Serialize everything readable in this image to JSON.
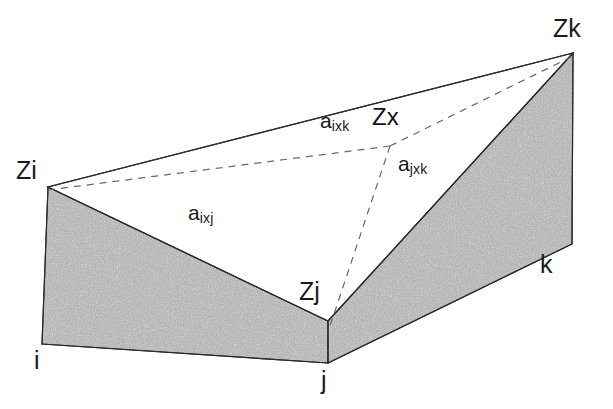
{
  "figure": {
    "type": "geometric-diagram",
    "background_color": "#ffffff",
    "ink_color": "#1a1a1a",
    "shade_fill": "#9a9a9a",
    "upper_vertices": [
      {
        "id": "Zi",
        "label": "Zi",
        "x": 48,
        "y": 187
      },
      {
        "id": "Zj",
        "label": "Zj",
        "x": 328,
        "y": 321
      },
      {
        "id": "Zk",
        "label": "Zk",
        "x": 573,
        "y": 53
      }
    ],
    "interior_point": {
      "id": "Zx",
      "label": "Zx",
      "x": 390,
      "y": 146
    },
    "base_vertices": [
      {
        "id": "i",
        "label": "i",
        "x": 42,
        "y": 344
      },
      {
        "id": "j",
        "label": "j",
        "x": 328,
        "y": 363
      },
      {
        "id": "k",
        "label": "k",
        "x": 572,
        "y": 244
      }
    ],
    "areas": [
      {
        "id": "a_ixj",
        "base": "a",
        "subscript": "ixj",
        "x": 196,
        "y": 205
      },
      {
        "id": "a_ixk",
        "base": "a",
        "subscript": "ixk",
        "x": 325,
        "y": 113
      },
      {
        "id": "a_jxk",
        "base": "a",
        "subscript": "jxk",
        "x": 400,
        "y": 156
      }
    ],
    "labels": {
      "Zi": "Zi",
      "Zj": "Zj",
      "Zk": "Zk",
      "Zx": "Zx",
      "i": "i",
      "j": "j",
      "k": "k"
    },
    "edges": {
      "solid": [
        {
          "from": "Zi",
          "to": "Zk",
          "style": "solid"
        },
        {
          "from": "Zi",
          "to": "Zj",
          "style": "solid"
        },
        {
          "from": "Zj",
          "to": "Zk",
          "style": "solid"
        },
        {
          "from": "Zi",
          "to": "i",
          "style": "solid"
        },
        {
          "from": "Zj",
          "to": "j",
          "style": "solid"
        },
        {
          "from": "Zk",
          "to": "k",
          "style": "solid"
        },
        {
          "from": "i",
          "to": "j",
          "style": "solid"
        },
        {
          "from": "j",
          "to": "k",
          "style": "solid"
        }
      ],
      "dashed": [
        {
          "from": "Zi",
          "to": "Zx",
          "style": "dashed"
        },
        {
          "from": "Zx",
          "to": "Zk",
          "style": "dashed"
        },
        {
          "from": "Zx",
          "to": "Zj",
          "style": "dashed"
        }
      ]
    },
    "panels": [
      {
        "id": "left-panel",
        "fill": "stipple-gray",
        "vertices": "Zi,Zj,j,i"
      },
      {
        "id": "right-panel",
        "fill": "stipple-gray",
        "vertices": "Zj,Zk,k,j"
      }
    ]
  }
}
